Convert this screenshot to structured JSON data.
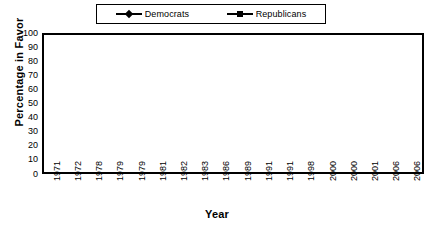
{
  "chart_data": {
    "type": "line",
    "title": "",
    "xlabel": "Year",
    "ylabel": "Percentage in Favor",
    "ylim": [
      0,
      100
    ],
    "ytick_step": 10,
    "yticks": [
      100,
      90,
      80,
      70,
      60,
      50,
      40,
      30,
      20,
      10,
      0
    ],
    "grid": true,
    "legend_position": "top-center",
    "categories": [
      "1971",
      "1972",
      "1978",
      "1979",
      "1979",
      "1981",
      "1982",
      "1983",
      "1986",
      "1989",
      "1991",
      "1991",
      "1998",
      "2000",
      "2000",
      "2001",
      "2006",
      "2006"
    ],
    "series": [
      {
        "name": "Democrats",
        "marker": "diamond",
        "color": "#000000",
        "values": [
          93,
          70,
          10,
          20,
          8,
          78,
          29,
          73,
          10,
          100,
          8,
          0,
          8,
          9,
          16,
          21,
          9,
          87
        ]
      },
      {
        "name": "Republicans",
        "marker": "square",
        "color": "#000000",
        "values": [
          40,
          86,
          81,
          86,
          46,
          99,
          50,
          94,
          79,
          100,
          80,
          91,
          96,
          96,
          93,
          100,
          96,
          10
        ]
      }
    ]
  },
  "legend": {
    "entries": [
      {
        "label": "Democrats",
        "marker": "diamond"
      },
      {
        "label": "Republicans",
        "marker": "square"
      }
    ]
  },
  "colors": {
    "series": "#000000",
    "grid": "#b4b4b4",
    "frame": "#000000",
    "background": "#ffffff"
  }
}
